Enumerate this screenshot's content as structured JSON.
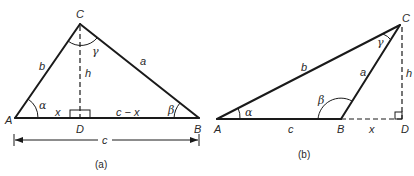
{
  "figure_a": {
    "caption": "(a)",
    "vertices": {
      "A": "A",
      "B": "B",
      "C": "C",
      "D": "D"
    },
    "sides": {
      "a": "a",
      "b": "b",
      "h": "h",
      "x": "x",
      "c_minus_x": "c − x",
      "c": "c"
    },
    "angles": {
      "alpha": "α",
      "beta": "β",
      "gamma": "γ"
    }
  },
  "figure_b": {
    "caption": "(b)",
    "vertices": {
      "A": "A",
      "B": "B",
      "C": "C",
      "D": "D"
    },
    "sides": {
      "a": "a",
      "b": "b",
      "c": "c",
      "h": "h",
      "x": "x"
    },
    "angles": {
      "alpha": "α",
      "beta": "β",
      "gamma": "γ"
    }
  }
}
